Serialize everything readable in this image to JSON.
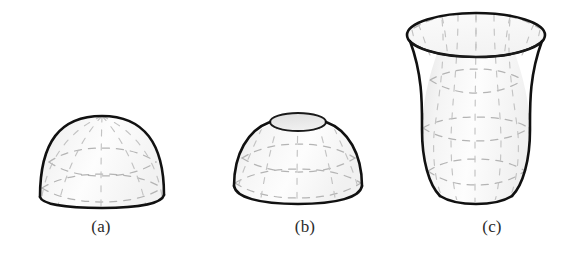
{
  "page": {
    "background_color": "#ffffff",
    "width": 566,
    "height": 254
  },
  "style": {
    "outline_color": "#111111",
    "grid_color": "#b4b4b4",
    "fill_light": "#ffffff",
    "fill_shade": "#ededed",
    "caption_color": "#2b2b2b"
  },
  "figures": [
    {
      "id": "a",
      "caption": "(a)",
      "shape_name": "hemisphere-dome",
      "description": "Closed dome (hemisphere) drawn in pencil style with dashed latitude and meridian lines",
      "open_top": false
    },
    {
      "id": "b",
      "caption": "(b)",
      "shape_name": "dome-with-circular-opening",
      "description": "Dome with a small elliptical opening cut at the top, dashed latitude and meridian lines",
      "open_top": true
    },
    {
      "id": "c",
      "caption": "(c)",
      "shape_name": "hyperboloid-of-one-sheet",
      "description": "Open hyperboloid of one sheet with wide elliptical rim at the top, waisted middle and flared base",
      "open_top": true
    }
  ]
}
